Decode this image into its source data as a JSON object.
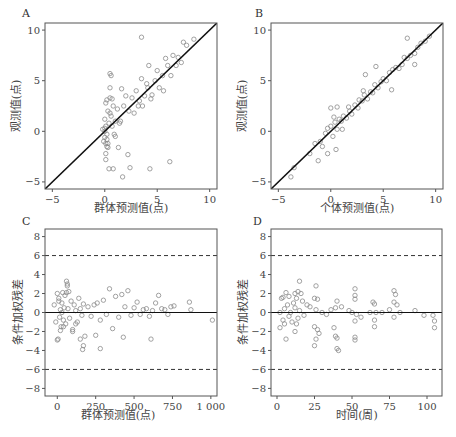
{
  "chart_data": [
    {
      "panel": "A",
      "type": "scatter",
      "title": "",
      "xlabel": "群体预测值(点)",
      "ylabel": "观测值(点)",
      "xlim": [
        -5.7,
        10.7
      ],
      "ylim": [
        -5.7,
        10.7
      ],
      "xticks": [
        -5,
        0,
        5,
        10
      ],
      "yticks": [
        -5,
        0,
        5,
        10
      ],
      "reference_line": "identity (y = x), solid black",
      "marker": "open circle, gray",
      "x": [
        0.0,
        0.1,
        0.2,
        0.0,
        -0.1,
        0.3,
        0.5,
        0.2,
        0.4,
        0.1,
        0.6,
        0.8,
        1.0,
        0.0,
        0.2,
        -0.2,
        0.1,
        0.3,
        0.5,
        0.7,
        1.2,
        1.5,
        1.8,
        2.0,
        2.3,
        2.6,
        3.0,
        3.2,
        3.5,
        3.8,
        4.0,
        4.2,
        4.5,
        4.8,
        5.0,
        5.2,
        5.5,
        5.8,
        6.0,
        6.3,
        6.5,
        6.8,
        7.0,
        7.3,
        7.5,
        7.8,
        8.5,
        0.5,
        0.6,
        0.5,
        1.6,
        1.7,
        0.4,
        0.8,
        2.4,
        4.3,
        6.2,
        0.1,
        0.3,
        0.2,
        1.0,
        1.3,
        2.2,
        2.8,
        3.3,
        3.6,
        4.1,
        4.4,
        3.5,
        5.6,
        0.0,
        0.1,
        0.7,
        0.9,
        1.4
      ],
      "y": [
        0.0,
        0.5,
        -0.3,
        1.2,
        -1.0,
        2.0,
        3.3,
        -1.5,
        0.8,
        -2.2,
        1.5,
        2.5,
        1.0,
        0.3,
        -0.8,
        0.2,
        2.8,
        -1.2,
        1.8,
        0.5,
        2.2,
        1.0,
        2.5,
        3.5,
        2.0,
        3.3,
        4.0,
        2.5,
        5.2,
        3.5,
        4.7,
        6.5,
        3.6,
        5.0,
        6.0,
        4.3,
        5.5,
        7.2,
        6.5,
        5.5,
        7.5,
        6.5,
        7.3,
        6.8,
        8.8,
        8.5,
        9.1,
        5.7,
        5.5,
        4.3,
        4.2,
        -4.5,
        -3.7,
        -3.7,
        -3.6,
        -3.7,
        -3.0,
        -2.8,
        -1.6,
        3.1,
        -0.5,
        -1.6,
        -2.3,
        1.8,
        3.0,
        2.5,
        4.3,
        3.2,
        9.3,
        4.0,
        -0.6,
        -1.2,
        3.2,
        -0.3,
        0.8
      ]
    },
    {
      "panel": "B",
      "type": "scatter",
      "title": "",
      "xlabel": "个体预测值(点)",
      "ylabel": "观测值(点)",
      "xlim": [
        -5.7,
        10.7
      ],
      "ylim": [
        -5.7,
        10.7
      ],
      "xticks": [
        -5,
        0,
        5,
        10
      ],
      "yticks": [
        -5,
        0,
        5,
        10
      ],
      "reference_line": "identity (y = x), solid black",
      "marker": "open circle, gray",
      "x": [
        -3.8,
        -3.5,
        -2.0,
        -1.5,
        -1.0,
        -0.8,
        -0.5,
        -0.3,
        0.0,
        0.2,
        0.4,
        0.6,
        0.8,
        1.0,
        1.2,
        1.5,
        1.8,
        2.0,
        2.3,
        2.6,
        3.0,
        3.2,
        3.5,
        3.8,
        4.0,
        4.2,
        4.5,
        4.8,
        5.0,
        5.3,
        5.6,
        5.9,
        6.2,
        6.5,
        6.8,
        7.0,
        7.3,
        7.6,
        8.0,
        8.3,
        8.6,
        9.0,
        9.4,
        -1.2,
        0.0,
        0.5,
        0.6,
        3.3,
        4.3,
        5.8,
        7.3,
        8.0,
        -0.3,
        0.3,
        1.1,
        1.7,
        2.7,
        3.1
      ],
      "y": [
        -4.5,
        -3.6,
        -2.2,
        -1.2,
        -1.0,
        -1.5,
        -0.2,
        0.3,
        0.5,
        -0.5,
        0.9,
        0.2,
        1.2,
        1.0,
        1.5,
        1.3,
        2.0,
        1.7,
        2.6,
        2.3,
        3.0,
        3.6,
        3.2,
        3.9,
        3.8,
        4.6,
        4.3,
        4.9,
        5.2,
        5.0,
        5.8,
        6.1,
        6.3,
        6.2,
        6.6,
        7.3,
        7.2,
        7.5,
        7.7,
        8.3,
        8.7,
        8.9,
        9.4,
        -2.9,
        2.3,
        -1.8,
        2.4,
        5.6,
        6.4,
        4.1,
        9.2,
        6.6,
        -2.2,
        1.4,
        0.2,
        2.4,
        3.1,
        4.0
      ]
    },
    {
      "panel": "C",
      "type": "scatter",
      "title": "",
      "xlabel": "群体预测值(点)",
      "ylabel": "条件加权残差",
      "xlim": [
        -80,
        1040
      ],
      "ylim": [
        -8.8,
        8.8
      ],
      "xticks": [
        0,
        250,
        500,
        750,
        1000
      ],
      "xtick_labels": [
        "0",
        "250",
        "500",
        "750",
        "1 000"
      ],
      "yticks": [
        -8,
        -6,
        -4,
        -2,
        0,
        2,
        4,
        6,
        8
      ],
      "reference_lines": [
        "y = 0 solid",
        "y = 6 dashed",
        "y = -6 dashed"
      ],
      "marker": "open circle, gray",
      "x": [
        -20,
        -10,
        0,
        5,
        10,
        15,
        20,
        25,
        30,
        35,
        40,
        45,
        50,
        55,
        60,
        65,
        70,
        75,
        80,
        90,
        100,
        110,
        120,
        130,
        140,
        150,
        160,
        170,
        180,
        200,
        220,
        240,
        260,
        280,
        300,
        320,
        340,
        360,
        380,
        400,
        420,
        440,
        460,
        480,
        500,
        520,
        540,
        560,
        580,
        600,
        620,
        640,
        660,
        680,
        700,
        720,
        740,
        760,
        860,
        870,
        1010,
        0,
        60,
        65,
        165,
        170,
        250,
        280,
        430,
        610,
        150,
        30,
        10,
        20,
        40,
        100,
        120
      ],
      "y": [
        0.8,
        -1.0,
        2.0,
        -2.8,
        1.5,
        -0.5,
        0.3,
        -1.5,
        1.0,
        2.1,
        -0.8,
        0.5,
        1.8,
        -1.2,
        3.3,
        2.8,
        0.4,
        2.2,
        -0.6,
        1.2,
        -1.8,
        0.8,
        0.2,
        -1.0,
        1.5,
        0.4,
        -0.3,
        0.9,
        -2.5,
        0.6,
        -0.4,
        0.8,
        1.0,
        -0.8,
        1.3,
        -0.2,
        2.5,
        -1.7,
        1.7,
        -0.5,
        1.9,
        0.6,
        2.3,
        -0.3,
        0.5,
        1.1,
        -0.2,
        0.3,
        0.4,
        -0.4,
        0.2,
        1.0,
        1.8,
        0.4,
        0.3,
        -0.2,
        0.6,
        0.7,
        1.1,
        0.3,
        -0.8,
        -2.9,
        2.1,
        3.0,
        -3.9,
        -3.5,
        -2.4,
        -3.8,
        -2.6,
        -2.8,
        -2.8,
        0.0,
        1.2,
        -1.9,
        -1.5,
        -2.0,
        -1.2
      ]
    },
    {
      "panel": "D",
      "type": "scatter",
      "title": "",
      "xlabel": "时间(周)",
      "ylabel": "条件加权残差",
      "xlim": [
        -4,
        110
      ],
      "ylim": [
        -8.8,
        8.8
      ],
      "xticks": [
        0,
        25,
        50,
        75,
        100
      ],
      "yticks": [
        -8,
        -6,
        -4,
        -2,
        0,
        2,
        4,
        6,
        8
      ],
      "reference_lines": [
        "y = 0 solid",
        "y = 6 dashed",
        "y = -6 dashed"
      ],
      "marker": "open circle, gray",
      "x": [
        2,
        2,
        3,
        4,
        4,
        5,
        5,
        6,
        6,
        7,
        8,
        8,
        9,
        10,
        11,
        12,
        12,
        12,
        13,
        13,
        14,
        14,
        15,
        15,
        16,
        17,
        18,
        20,
        22,
        25,
        25,
        25,
        26,
        26,
        26,
        27,
        27,
        28,
        30,
        33,
        36,
        38,
        39,
        39,
        40,
        40,
        40,
        41,
        43,
        48,
        50,
        52,
        52,
        52,
        52,
        52,
        52,
        53,
        56,
        62,
        64,
        65,
        65,
        65,
        66,
        70,
        75,
        78,
        78,
        78,
        79,
        80,
        82,
        92,
        98,
        104,
        105,
        105
      ],
      "y": [
        0.0,
        -1.6,
        1.5,
        -0.8,
        1.6,
        -1.2,
        0.4,
        2.1,
        -2.8,
        0.8,
        -0.4,
        1.7,
        0.0,
        -1.0,
        1.0,
        2.0,
        -2.0,
        0.5,
        1.5,
        -1.2,
        2.2,
        -0.6,
        3.3,
        0.2,
        2.0,
        1.2,
        -0.3,
        0.8,
        0.6,
        1.5,
        -1.5,
        -3.5,
        2.8,
        -2.8,
        0.3,
        -1.8,
        1.4,
        -2.2,
        0.0,
        -0.2,
        0.3,
        -1.6,
        0.5,
        -2.5,
        1.2,
        -3.8,
        -2.7,
        -4.0,
        0.6,
        0.2,
        0.0,
        2.5,
        1.8,
        -0.9,
        -2.6,
        -2.9,
        1.4,
        -0.2,
        -0.5,
        0.0,
        1.1,
        -0.8,
        -1.5,
        0.9,
        0.0,
        0.0,
        0.3,
        2.3,
        -0.5,
        1.1,
        1.9,
        0.8,
        0.0,
        0.2,
        -0.3,
        -0.3,
        -0.9,
        -1.6
      ]
    }
  ],
  "panels": {
    "A": {
      "label": "A",
      "xlabel": "群体预测值(点)",
      "ylabel": "观测值(点)",
      "xtick_labels": [
        "−5",
        "0",
        "5",
        "10"
      ],
      "ytick_labels": [
        "−5",
        "0",
        "5",
        "10"
      ]
    },
    "B": {
      "label": "B",
      "xlabel": "个体预测值(点)",
      "ylabel": "观测值(点)",
      "xtick_labels": [
        "−5",
        "0",
        "5",
        "10"
      ],
      "ytick_labels": [
        "−5",
        "0",
        "5",
        "10"
      ]
    },
    "C": {
      "label": "C",
      "xlabel": "群体预测值(点)",
      "ylabel": "条件加权残差",
      "xtick_labels": [
        "0",
        "250",
        "500",
        "750",
        "1 000"
      ],
      "ytick_labels": [
        "−8",
        "−6",
        "−4",
        "−2",
        "0",
        "2",
        "4",
        "6",
        "8"
      ]
    },
    "D": {
      "label": "D",
      "xlabel": "时间(周)",
      "ylabel": "条件加权残差",
      "xtick_labels": [
        "0",
        "25",
        "50",
        "75",
        "100"
      ],
      "ytick_labels": [
        "−8",
        "−6",
        "−4",
        "−2",
        "0",
        "2",
        "4",
        "6",
        "8"
      ]
    }
  },
  "colors": {
    "axis": "#555555",
    "point": "#8a8a8a",
    "line": "#111111",
    "text": "#444444"
  }
}
